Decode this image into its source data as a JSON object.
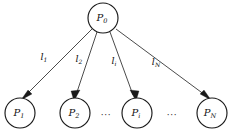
{
  "figure": {
    "type": "star-topology-diagram",
    "width": 236,
    "height": 137,
    "background_color": "#ffffff",
    "stroke_color": "#1a1a1a",
    "text_color": "#111111"
  },
  "root_node": {
    "id": "P0",
    "base": "P",
    "subscript": "0",
    "cx": 103,
    "cy": 18,
    "r": 15
  },
  "leaf_nodes": [
    {
      "id": "P1",
      "base": "P",
      "subscript": "1",
      "cx": 20,
      "cy": 113,
      "r": 15
    },
    {
      "id": "P2",
      "base": "P",
      "subscript": "2",
      "cx": 75,
      "cy": 113,
      "r": 15
    },
    {
      "id": "Pi",
      "base": "P",
      "subscript": "i",
      "cx": 137,
      "cy": 113,
      "r": 15
    },
    {
      "id": "PN",
      "base": "P",
      "subscript": "N",
      "cx": 212,
      "cy": 113,
      "r": 15
    }
  ],
  "edges": [
    {
      "id": "edge-l1",
      "from": "P0",
      "to": "P1",
      "label_base": "l",
      "label_subscript": "1",
      "label_x": 44,
      "label_y": 57,
      "x1": 92,
      "y1": 29,
      "x2": 24,
      "y2": 97
    },
    {
      "id": "edge-l2",
      "from": "P0",
      "to": "P2",
      "label_base": "l",
      "label_subscript": "2",
      "label_x": 79,
      "label_y": 59,
      "x1": 97,
      "y1": 32,
      "x2": 74,
      "y2": 97
    },
    {
      "id": "edge-li",
      "from": "P0",
      "to": "Pi",
      "label_base": "l",
      "label_subscript": "i",
      "label_x": 114,
      "label_y": 61,
      "x1": 110,
      "y1": 32,
      "x2": 134,
      "y2": 97
    },
    {
      "id": "edge-lN",
      "from": "P0",
      "to": "PN",
      "label_base": "l",
      "label_subscript": "N",
      "label_x": 156,
      "label_y": 62,
      "x1": 116,
      "y1": 29,
      "x2": 206,
      "y2": 97
    }
  ],
  "ellipses": [
    {
      "id": "ellipsis-left",
      "text": "···",
      "x": 106,
      "y": 115
    },
    {
      "id": "ellipsis-right",
      "text": "···",
      "x": 172,
      "y": 115
    }
  ]
}
